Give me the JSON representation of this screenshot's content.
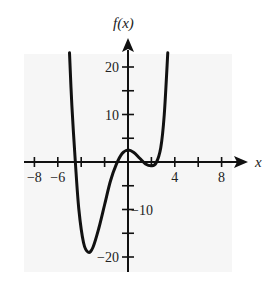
{
  "chart_data": {
    "type": "line",
    "title": "",
    "xlabel": "x",
    "ylabel": "f(x)",
    "xlim": [
      -9,
      9
    ],
    "ylim": [
      -22,
      24
    ],
    "grid": false,
    "x_ticks": [
      -8,
      -6,
      -4,
      -2,
      0,
      2,
      4,
      6,
      8
    ],
    "x_tick_labels": [
      {
        "value": -8,
        "label": "−8"
      },
      {
        "value": -6,
        "label": "−6"
      },
      {
        "value": 4,
        "label": "4"
      },
      {
        "value": 8,
        "label": "8"
      }
    ],
    "y_ticks": [
      -20,
      -15,
      -10,
      -5,
      5,
      10,
      15,
      20
    ],
    "y_tick_labels": [
      {
        "value": 20,
        "label": "20"
      },
      {
        "value": 10,
        "label": "10"
      },
      {
        "value": -10,
        "label": "−10"
      },
      {
        "value": -20,
        "label": "−20"
      }
    ],
    "series": [
      {
        "name": "f(x)",
        "color": "#111111",
        "points": [
          [
            -5.0,
            23
          ],
          [
            -4.8,
            12
          ],
          [
            -4.5,
            0
          ],
          [
            -4.2,
            -10
          ],
          [
            -3.8,
            -17
          ],
          [
            -3.4,
            -19
          ],
          [
            -3.0,
            -18
          ],
          [
            -2.5,
            -14
          ],
          [
            -2.0,
            -9
          ],
          [
            -1.5,
            -4
          ],
          [
            -1.0,
            -0.5
          ],
          [
            -0.5,
            1.8
          ],
          [
            0.0,
            2.5
          ],
          [
            0.5,
            2.0
          ],
          [
            1.0,
            0.8
          ],
          [
            1.5,
            -0.4
          ],
          [
            2.0,
            -0.8
          ],
          [
            2.4,
            -0.2
          ],
          [
            2.8,
            3
          ],
          [
            3.1,
            10
          ],
          [
            3.4,
            23
          ]
        ]
      }
    ]
  },
  "labels": {
    "y_axis_title": "f(x)",
    "x_axis_title": "x"
  },
  "colors": {
    "curve": "#111111",
    "axes": "#111111",
    "panel": "#f6f6f6",
    "background": "#ffffff"
  }
}
